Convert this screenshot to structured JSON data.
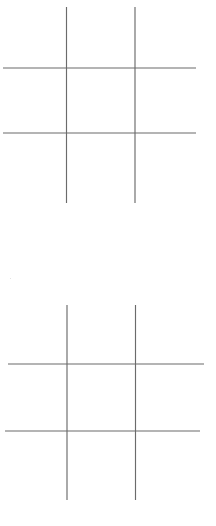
{
  "page": {
    "background_color": "#ffffff",
    "width": 216,
    "height": 526
  },
  "style": {
    "line_color": "#6b6b6b",
    "line_width": 1.15
  },
  "boards": [
    {
      "name": "upper-board",
      "label": "Upper tic-tac-toe grid",
      "lines": [
        {
          "name": "vertical-left",
          "orientation": "vertical",
          "x1": 66.5,
          "y1": 7,
          "x2": 66.5,
          "y2": 203
        },
        {
          "name": "vertical-right",
          "orientation": "vertical",
          "x1": 135.0,
          "y1": 7,
          "x2": 135.0,
          "y2": 203
        },
        {
          "name": "horizontal-top",
          "orientation": "horizontal",
          "x1": 3,
          "y1": 68,
          "x2": 196,
          "y2": 68
        },
        {
          "name": "horizontal-bottom",
          "orientation": "horizontal",
          "x1": 3,
          "y1": 133,
          "x2": 196,
          "y2": 133
        }
      ],
      "cells": [
        {
          "name": "cell-top-left",
          "row": 0,
          "col": 0,
          "mark": "",
          "x": 3,
          "y": 7,
          "w": 63.5,
          "h": 61
        },
        {
          "name": "cell-top-center",
          "row": 0,
          "col": 1,
          "mark": "",
          "x": 66.5,
          "y": 7,
          "w": 68.5,
          "h": 61
        },
        {
          "name": "cell-top-right",
          "row": 0,
          "col": 2,
          "mark": "",
          "x": 135.0,
          "y": 7,
          "w": 61,
          "h": 61
        },
        {
          "name": "cell-middle-left",
          "row": 1,
          "col": 0,
          "mark": "",
          "x": 3,
          "y": 68,
          "w": 63.5,
          "h": 65
        },
        {
          "name": "cell-middle-center",
          "row": 1,
          "col": 1,
          "mark": "",
          "x": 66.5,
          "y": 68,
          "w": 68.5,
          "h": 65
        },
        {
          "name": "cell-middle-right",
          "row": 1,
          "col": 2,
          "mark": "",
          "x": 135.0,
          "y": 68,
          "w": 61,
          "h": 65
        },
        {
          "name": "cell-bottom-left",
          "row": 2,
          "col": 0,
          "mark": "",
          "x": 3,
          "y": 133,
          "w": 63.5,
          "h": 70
        },
        {
          "name": "cell-bottom-center",
          "row": 2,
          "col": 1,
          "mark": "",
          "x": 66.5,
          "y": 133,
          "w": 68.5,
          "h": 70
        },
        {
          "name": "cell-bottom-right",
          "row": 2,
          "col": 2,
          "mark": "",
          "x": 135.0,
          "y": 133,
          "w": 61,
          "h": 70
        }
      ]
    },
    {
      "name": "lower-board",
      "label": "Lower tic-tac-toe grid",
      "lines": [
        {
          "name": "vertical-left",
          "orientation": "vertical",
          "x1": 67.0,
          "y1": 305,
          "x2": 67.0,
          "y2": 500
        },
        {
          "name": "vertical-right",
          "orientation": "vertical",
          "x1": 135.5,
          "y1": 305,
          "x2": 135.5,
          "y2": 500
        },
        {
          "name": "horizontal-top",
          "orientation": "horizontal",
          "x1": 8,
          "y1": 364,
          "x2": 204,
          "y2": 364
        },
        {
          "name": "horizontal-bottom",
          "orientation": "horizontal",
          "x1": 5,
          "y1": 431,
          "x2": 200,
          "y2": 431
        }
      ],
      "cells": [
        {
          "name": "cell-top-left",
          "row": 0,
          "col": 0,
          "mark": "",
          "x": 8,
          "y": 305,
          "w": 59,
          "h": 59
        },
        {
          "name": "cell-top-center",
          "row": 0,
          "col": 1,
          "mark": "",
          "x": 67.0,
          "y": 305,
          "w": 68.5,
          "h": 59
        },
        {
          "name": "cell-top-right",
          "row": 0,
          "col": 2,
          "mark": "",
          "x": 135.5,
          "y": 305,
          "w": 68.5,
          "h": 59
        },
        {
          "name": "cell-middle-left",
          "row": 1,
          "col": 0,
          "mark": "",
          "x": 8,
          "y": 364,
          "w": 59,
          "h": 67
        },
        {
          "name": "cell-middle-center",
          "row": 1,
          "col": 1,
          "mark": "",
          "x": 67.0,
          "y": 364,
          "w": 68.5,
          "h": 67
        },
        {
          "name": "cell-middle-right",
          "row": 1,
          "col": 2,
          "mark": "",
          "x": 135.5,
          "y": 364,
          "w": 68.5,
          "h": 67
        },
        {
          "name": "cell-bottom-left",
          "row": 2,
          "col": 0,
          "mark": "",
          "x": 8,
          "y": 431,
          "w": 59,
          "h": 69
        },
        {
          "name": "cell-bottom-center",
          "row": 2,
          "col": 1,
          "mark": "",
          "x": 67.0,
          "y": 431,
          "w": 68.5,
          "h": 69
        },
        {
          "name": "cell-bottom-right",
          "row": 2,
          "col": 2,
          "mark": "",
          "x": 135.5,
          "y": 431,
          "w": 68.5,
          "h": 69
        }
      ]
    }
  ],
  "artifacts": [
    {
      "name": "scan-speck",
      "x": 10,
      "y": 278
    }
  ]
}
